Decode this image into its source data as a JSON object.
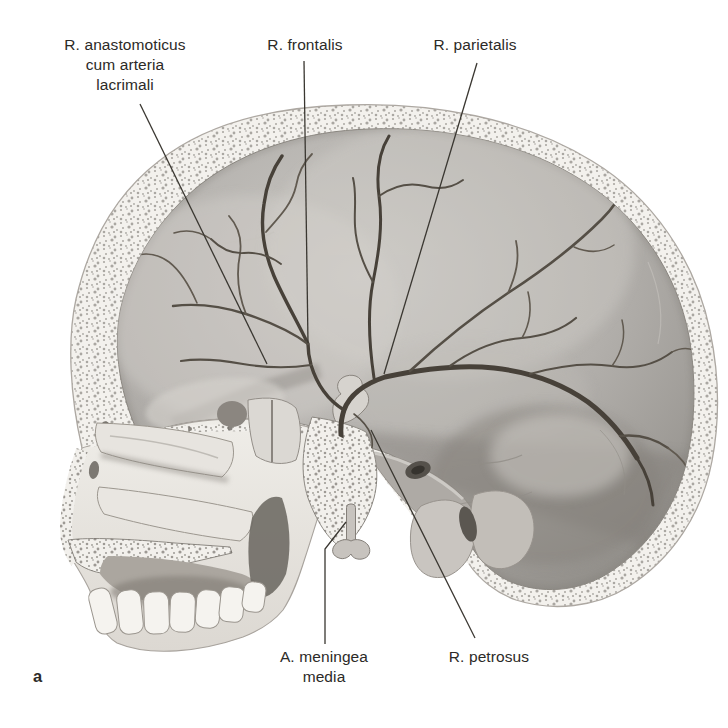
{
  "figure": {
    "caption_letter": "a",
    "labels": {
      "anastomoticus": "R. anastomoticus\ncum arteria\nlacrimali",
      "frontalis": "R. frontalis",
      "parietalis": "R. parietalis",
      "meningea_media": "A. meningea\nmedia",
      "petrosus": "R. petrosus"
    },
    "colors": {
      "background": "#ffffff",
      "label_text": "#2c2a27",
      "leader_line": "#3a3731",
      "artery_dark": "#474139",
      "bone_light": "#f3f1ed",
      "bone_stipple": "#56524c",
      "cavity_gray_light": "#cac8c4",
      "cavity_gray_dark": "#908d88"
    }
  }
}
